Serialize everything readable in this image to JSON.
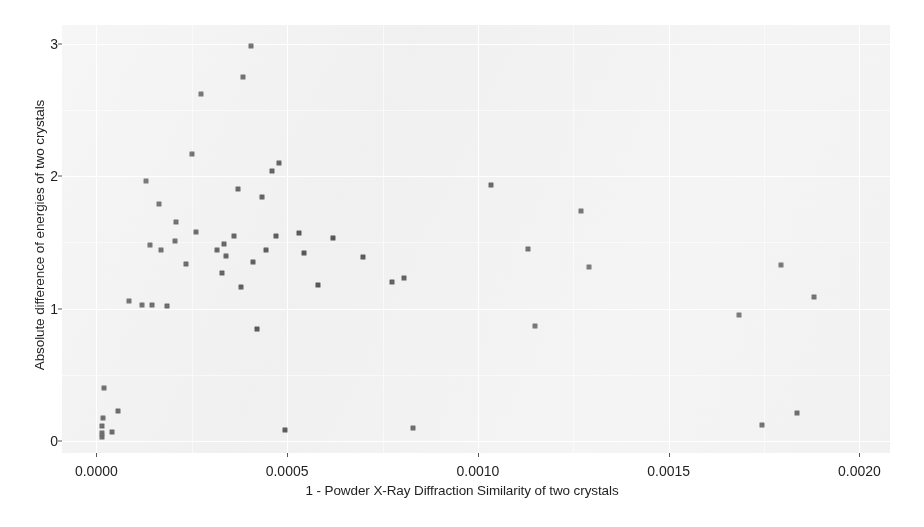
{
  "chart_data": {
    "type": "scatter",
    "title": "",
    "xlabel": "1 - Powder X-Ray Diffraction Similarity of two crystals",
    "ylabel": "Absolute difference of energies of two crystals",
    "xlim": [
      -9e-05,
      0.00208
    ],
    "ylim": [
      -0.09,
      3.14
    ],
    "xticks": [
      0.0,
      0.0005,
      0.001,
      0.0015,
      0.002
    ],
    "xticklabels": [
      "0.0000",
      "0.0005",
      "0.0010",
      "0.0015",
      "0.0020"
    ],
    "yticks": [
      0,
      1,
      2,
      3
    ],
    "yticklabels": [
      "0",
      "1",
      "2",
      "3"
    ],
    "grid": true,
    "legend": "none",
    "panel_background": "#ebebeb",
    "gridline_color": "#ffffff",
    "marker_color": "#1a1a1a",
    "marker_shape": "square",
    "points": [
      {
        "x": 1.5e-05,
        "y": 0.06
      },
      {
        "x": 1.5e-05,
        "y": 0.11
      },
      {
        "x": 1.6e-05,
        "y": 0.03
      },
      {
        "x": 1.8e-05,
        "y": 0.175
      },
      {
        "x": 2e-05,
        "y": 0.4
      },
      {
        "x": 4.2e-05,
        "y": 0.07
      },
      {
        "x": 5.6e-05,
        "y": 0.225
      },
      {
        "x": 8.5e-05,
        "y": 1.06
      },
      {
        "x": 0.00012,
        "y": 1.03
      },
      {
        "x": 0.00013,
        "y": 1.965
      },
      {
        "x": 0.00014,
        "y": 1.48
      },
      {
        "x": 0.000145,
        "y": 1.03
      },
      {
        "x": 0.000165,
        "y": 1.79
      },
      {
        "x": 0.00017,
        "y": 1.44
      },
      {
        "x": 0.000185,
        "y": 1.02
      },
      {
        "x": 0.000205,
        "y": 1.51
      },
      {
        "x": 0.00021,
        "y": 1.65
      },
      {
        "x": 0.000235,
        "y": 1.34
      },
      {
        "x": 0.00025,
        "y": 2.17
      },
      {
        "x": 0.00026,
        "y": 1.58
      },
      {
        "x": 0.000275,
        "y": 2.62
      },
      {
        "x": 0.000315,
        "y": 1.44
      },
      {
        "x": 0.00033,
        "y": 1.265
      },
      {
        "x": 0.000335,
        "y": 1.49
      },
      {
        "x": 0.00034,
        "y": 1.4
      },
      {
        "x": 0.00036,
        "y": 1.545
      },
      {
        "x": 0.00037,
        "y": 1.9
      },
      {
        "x": 0.00038,
        "y": 1.165
      },
      {
        "x": 0.000385,
        "y": 2.75
      },
      {
        "x": 0.000405,
        "y": 2.98
      },
      {
        "x": 0.00041,
        "y": 1.35
      },
      {
        "x": 0.00042,
        "y": 0.845
      },
      {
        "x": 0.000435,
        "y": 1.84
      },
      {
        "x": 0.000445,
        "y": 1.44
      },
      {
        "x": 0.00046,
        "y": 2.04
      },
      {
        "x": 0.00047,
        "y": 1.545
      },
      {
        "x": 0.00048,
        "y": 2.1
      },
      {
        "x": 0.000495,
        "y": 0.085
      },
      {
        "x": 0.00053,
        "y": 1.57
      },
      {
        "x": 0.000545,
        "y": 1.42
      },
      {
        "x": 0.00058,
        "y": 1.18
      },
      {
        "x": 0.00062,
        "y": 1.53
      },
      {
        "x": 0.0007,
        "y": 1.39
      },
      {
        "x": 0.000775,
        "y": 1.2
      },
      {
        "x": 0.000805,
        "y": 1.23
      },
      {
        "x": 0.00083,
        "y": 0.1
      },
      {
        "x": 0.001035,
        "y": 1.93
      },
      {
        "x": 0.00113,
        "y": 1.45
      },
      {
        "x": 0.00115,
        "y": 0.865
      },
      {
        "x": 0.00127,
        "y": 1.735
      },
      {
        "x": 0.00129,
        "y": 1.31
      },
      {
        "x": 0.001685,
        "y": 0.95
      },
      {
        "x": 0.001745,
        "y": 0.125
      },
      {
        "x": 0.001795,
        "y": 1.33
      },
      {
        "x": 0.001835,
        "y": 0.215
      },
      {
        "x": 0.00188,
        "y": 1.085
      }
    ]
  }
}
